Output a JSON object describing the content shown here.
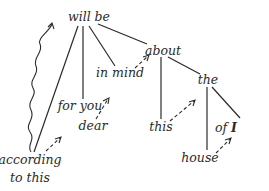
{
  "diagram": {
    "type": "dependency-tree",
    "nodes": [
      {
        "id": "will_be",
        "label": "will be",
        "x": 89,
        "y": 21
      },
      {
        "id": "about",
        "label": "about",
        "x": 163,
        "y": 55
      },
      {
        "id": "in_mind",
        "label": "in mind",
        "x": 120,
        "y": 77
      },
      {
        "id": "for_you",
        "label": "for you",
        "x": 80,
        "y": 110
      },
      {
        "id": "dear",
        "label": "dear",
        "x": 93,
        "y": 130
      },
      {
        "id": "according",
        "label": "according",
        "x": 30,
        "y": 164
      },
      {
        "id": "to_this",
        "label": "to this",
        "x": 30,
        "y": 182
      },
      {
        "id": "the",
        "label": "the",
        "x": 208,
        "y": 84
      },
      {
        "id": "this",
        "label": "this",
        "x": 161,
        "y": 131
      },
      {
        "id": "of",
        "label": "of",
        "x": 217,
        "y": 132
      },
      {
        "id": "I",
        "label": "I",
        "x": 232,
        "y": 132
      },
      {
        "id": "house",
        "label": "house",
        "x": 200,
        "y": 162
      }
    ],
    "edges": [
      {
        "from": "will_be",
        "to": "according",
        "style": "solid"
      },
      {
        "from": "will_be",
        "to": "for_you",
        "style": "solid"
      },
      {
        "from": "will_be",
        "to": "in_mind",
        "style": "solid"
      },
      {
        "from": "will_be",
        "to": "about",
        "style": "solid"
      },
      {
        "from": "about",
        "to": "this",
        "style": "solid"
      },
      {
        "from": "about",
        "to": "the",
        "style": "solid"
      },
      {
        "from": "the",
        "to": "house",
        "style": "solid"
      },
      {
        "from": "the",
        "to": "of_I",
        "style": "solid"
      },
      {
        "from": "according",
        "to": "dear",
        "style": "dashed-arrow"
      },
      {
        "from": "dear",
        "to": "in_mind",
        "style": "dashed-arrow"
      },
      {
        "from": "in_mind",
        "to": "about",
        "style": "dashed-arrow"
      },
      {
        "from": "this",
        "to": "the",
        "style": "dashed-arrow"
      },
      {
        "from": "house",
        "to": "of_I",
        "style": "dashed-arrow"
      },
      {
        "from": "according",
        "to": "will_be",
        "style": "wavy-arrow"
      }
    ]
  }
}
